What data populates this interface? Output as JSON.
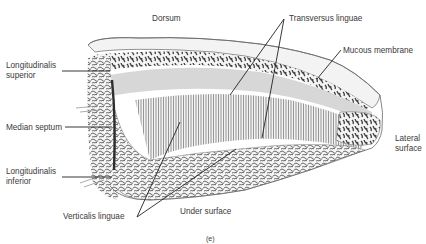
{
  "figure": {
    "caption": "(e)"
  },
  "labels": {
    "dorsum": "Dorsum",
    "transversus_linguae": "Transversus linguae",
    "mucous_membrane": "Mucous membrane",
    "longitudinalis_superior_1": "Longitudinalis",
    "longitudinalis_superior_2": "superior",
    "median_septum": "Median septum",
    "longitudinalis_inferior_1": "Longitudinalis",
    "longitudinalis_inferior_2": "inferior",
    "lateral_surface_1": "Lateral",
    "lateral_surface_2": "surface",
    "verticalis_linguae": "Verticalis linguae",
    "under_surface": "Under surface"
  },
  "colors": {
    "background": "#ffffff",
    "tissue_light": "#e9e9e9",
    "tissue_mid": "#9a9a9a",
    "tissue_dark": "#4a4a4a",
    "leader_line": "#222222",
    "text": "#3a3a3a"
  }
}
